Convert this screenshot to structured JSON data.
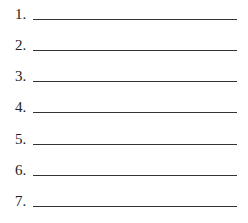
{
  "list": {
    "items": [
      {
        "label": "1.",
        "value": ""
      },
      {
        "label": "2.",
        "value": ""
      },
      {
        "label": "3.",
        "value": ""
      },
      {
        "label": "4.",
        "value": ""
      },
      {
        "label": "5.",
        "value": ""
      },
      {
        "label": "6.",
        "value": ""
      },
      {
        "label": "7.",
        "value": ""
      }
    ]
  }
}
